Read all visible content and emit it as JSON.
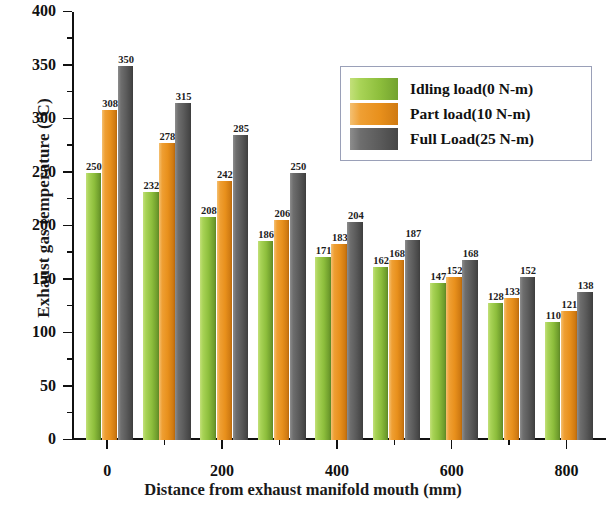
{
  "chart_data": {
    "type": "bar",
    "title": "",
    "xlabel": "Distance from exhaust manifold mouth (mm)",
    "ylabel": "Exhaust gas temperature (°C)",
    "categories": [
      0,
      100,
      200,
      300,
      400,
      500,
      600,
      700,
      800
    ],
    "xtick_labels": [
      "0",
      "200",
      "400",
      "600",
      "800"
    ],
    "xtick_values": [
      0,
      200,
      400,
      600,
      800
    ],
    "xlim": [
      -60,
      870
    ],
    "ylim": [
      0,
      400
    ],
    "ytick_labels": [
      "0",
      "50",
      "100",
      "150",
      "200",
      "250",
      "300",
      "350",
      "400"
    ],
    "ytick_values": [
      0,
      50,
      100,
      150,
      200,
      250,
      300,
      350,
      400
    ],
    "y_minor_step": 25,
    "x_minor_step": 100,
    "grid": false,
    "legend_position": "top-right",
    "series": [
      {
        "name": "Idling load(0 N-m)",
        "color": "#8dbe3c",
        "values": [
          250,
          232,
          208,
          186,
          171,
          162,
          147,
          128,
          110
        ]
      },
      {
        "name": "Part load(10 N-m)",
        "color": "#e8901c",
        "values": [
          308,
          278,
          242,
          206,
          183,
          168,
          152,
          133,
          121
        ]
      },
      {
        "name": "Full Load(25 N-m)",
        "color": "#5b5b5b",
        "values": [
          350,
          315,
          285,
          250,
          204,
          187,
          168,
          152,
          138
        ]
      }
    ]
  },
  "legend": {
    "items": [
      {
        "label": "Idling load(0 N-m)",
        "color": "#8dbe3c"
      },
      {
        "label": "Part load(10 N-m)",
        "color": "#e8901c"
      },
      {
        "label": "Full Load(25 N-m)",
        "color": "#5b5b5b"
      }
    ]
  }
}
